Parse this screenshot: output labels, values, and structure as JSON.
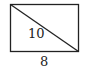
{
  "figure": {
    "shape": "rectangle",
    "has_diagonal": true,
    "diagonal_direction": "top-left to bottom-right",
    "diagonal_label": "10",
    "bottom_side_label": "8",
    "stroke_color": "#222222",
    "background_color": "#ffffff"
  }
}
